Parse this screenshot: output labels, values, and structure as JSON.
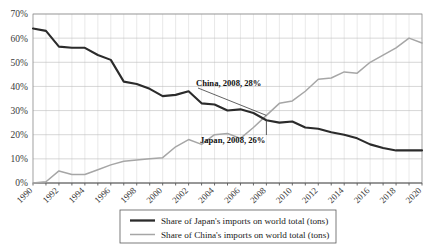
{
  "chart_data": {
    "type": "line",
    "title": "",
    "subtitle": "",
    "xlabel": "",
    "ylabel": "",
    "xlim": [
      1990,
      2020
    ],
    "ylim": [
      0,
      70
    ],
    "grid": true,
    "legend_position": "bottom",
    "x": [
      1990,
      1991,
      1992,
      1993,
      1994,
      1995,
      1996,
      1997,
      1998,
      1999,
      2000,
      2001,
      2002,
      2003,
      2004,
      2005,
      2006,
      2007,
      2008,
      2009,
      2010,
      2011,
      2012,
      2013,
      2014,
      2015,
      2016,
      2017,
      2018,
      2019,
      2020
    ],
    "xtick_labels": [
      "1990",
      "1992",
      "1994",
      "1996",
      "1998",
      "2000",
      "2002",
      "2004",
      "2006",
      "2008",
      "2010",
      "2012",
      "2014",
      "2016",
      "2018",
      "2020"
    ],
    "ytick_labels": [
      "0%",
      "10%",
      "20%",
      "30%",
      "40%",
      "50%",
      "60%",
      "70%"
    ],
    "ytick_values": [
      0,
      10,
      20,
      30,
      40,
      50,
      60,
      70
    ],
    "series": [
      {
        "name": "Share of Japan's imports on world total (tons)",
        "color": "#2b2b2b",
        "values": [
          64,
          63,
          56.5,
          56,
          56,
          53,
          51,
          42,
          41,
          39,
          36,
          36.5,
          38,
          33,
          32.5,
          30,
          30.5,
          29,
          26,
          25,
          25.5,
          23,
          22.5,
          21,
          20,
          18.5,
          16,
          14.5,
          13.5,
          13.5,
          13.5
        ]
      },
      {
        "name": "Share of China's imports on world total (tons)",
        "color": "#a6a6a6",
        "values": [
          0,
          0.5,
          5,
          3.5,
          3.5,
          5.5,
          7.5,
          9,
          9.5,
          10,
          10.5,
          15,
          18,
          16,
          20,
          20.5,
          18.5,
          23,
          28,
          33,
          34,
          38,
          43,
          43.5,
          46,
          45.5,
          50,
          53,
          56,
          60,
          58
        ]
      }
    ],
    "annotations": [
      {
        "text": "China, 2008, 28%",
        "series": "china",
        "x": 2008,
        "y": 28
      },
      {
        "text": "Japan, 2008, 26%",
        "series": "japan",
        "x": 2008,
        "y": 26
      }
    ],
    "legend": [
      {
        "label": "Share of Japan's imports on world total (tons)",
        "color": "#2b2b2b",
        "style": "thick"
      },
      {
        "label": "Share of China's imports on world total (tons)",
        "color": "#a6a6a6",
        "style": "thin"
      }
    ]
  },
  "colors": {
    "japan": "#2b2b2b",
    "china": "#a6a6a6",
    "grid": "#d2d2d2",
    "gridMajor": "#bcbcbc",
    "axis": "#5a5a5a",
    "background": "#ffffff"
  }
}
